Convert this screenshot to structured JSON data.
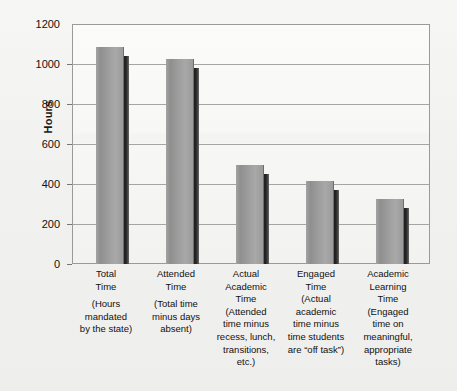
{
  "chart_data": {
    "type": "bar",
    "title": "",
    "xlabel": "",
    "ylabel": "Hours",
    "ylim": [
      0,
      1200
    ],
    "yticks": [
      0,
      200,
      400,
      600,
      800,
      1000,
      1200
    ],
    "ytick_labels": [
      "0",
      "200",
      "400",
      "600",
      "800",
      "1000",
      "1200"
    ],
    "grid": true,
    "legend": "none",
    "style": "3d-bar",
    "bar_face_color": "#9b9b9b",
    "bar_shadow_color": "#262626",
    "plot_border_color": "#9a9a9a",
    "background_color": "#f1f1ef",
    "categories": [
      "Total Time",
      "Attended Time",
      "Actual Academic Time",
      "Engaged Time",
      "Academic Learning Time"
    ],
    "values": [
      1085,
      1025,
      495,
      415,
      325
    ],
    "series": [
      {
        "name": "Hours",
        "values": [
          1085,
          1025,
          495,
          415,
          325
        ]
      }
    ],
    "category_details": [
      {
        "title_lines": [
          "Total",
          "Time"
        ],
        "desc_lines": [
          "(Hours",
          "mandated",
          "by the state)"
        ],
        "value": 1085
      },
      {
        "title_lines": [
          "Attended",
          "Time"
        ],
        "desc_lines": [
          "(Total time",
          "minus days",
          "absent)"
        ],
        "value": 1025
      },
      {
        "title_lines": [
          "Actual",
          "Academic",
          "Time"
        ],
        "desc_lines": [
          "(Attended",
          "time minus",
          "recess, lunch,",
          "transitions,",
          "etc.)"
        ],
        "value": 495
      },
      {
        "title_lines": [
          "Engaged",
          "Time"
        ],
        "desc_lines": [
          "(Actual",
          "academic",
          "time minus",
          "time students",
          "are “off task”)"
        ],
        "value": 415
      },
      {
        "title_lines": [
          "Academic",
          "Learning",
          "Time"
        ],
        "desc_lines": [
          "(Engaged",
          "time on",
          "meaningful,",
          "appropriate",
          "tasks)"
        ],
        "value": 325
      }
    ]
  },
  "axis": {
    "y_title": "Hours",
    "ticks": {
      "t0": "0",
      "t200": "200",
      "t400": "400",
      "t600": "600",
      "t800": "800",
      "t1000": "1000",
      "t1200": "1200"
    }
  },
  "categories": {
    "c0": {
      "l0": "Total",
      "l1": "Time",
      "d0": "(Hours",
      "d1": "mandated",
      "d2": "by the state)"
    },
    "c1": {
      "l0": "Attended",
      "l1": "Time",
      "d0": "(Total time",
      "d1": "minus days",
      "d2": "absent)"
    },
    "c2": {
      "l0": "Actual",
      "l1": "Academic",
      "l2": "Time",
      "d0": "(Attended",
      "d1": "time minus",
      "d2": "recess, lunch,",
      "d3": "transitions,",
      "d4": "etc.)"
    },
    "c3": {
      "l0": "Engaged",
      "l1": "Time",
      "d0": "(Actual",
      "d1": "academic",
      "d2": "time minus",
      "d3": "time students",
      "d4": "are “off task”)"
    },
    "c4": {
      "l0": "Academic",
      "l1": "Learning",
      "l2": "Time",
      "d0": "(Engaged",
      "d1": "time on",
      "d2": "meaningful,",
      "d3": "appropriate",
      "d4": "tasks)"
    }
  }
}
